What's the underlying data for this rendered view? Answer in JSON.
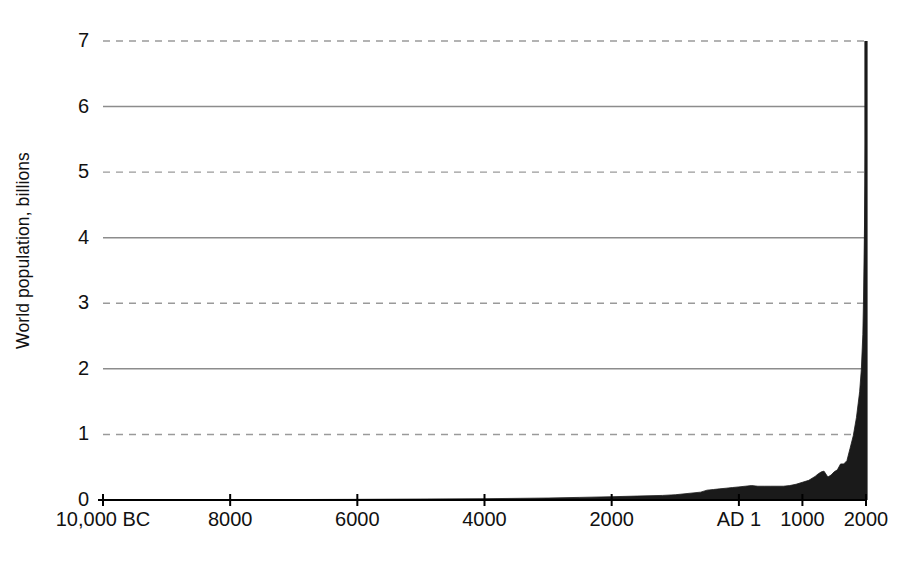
{
  "chart_data": {
    "type": "area",
    "title": "",
    "xlabel": "",
    "ylabel": "World population, billions",
    "xlim": [
      -10000,
      2000
    ],
    "ylim": [
      0,
      7
    ],
    "grid": true,
    "legend": null,
    "x_tick_labels": [
      "10,000 BC",
      "8000",
      "6000",
      "4000",
      "2000",
      "AD 1",
      "1000",
      "2000"
    ],
    "x_tick_values": [
      -10000,
      -8000,
      -6000,
      -4000,
      -2000,
      1,
      1000,
      2000
    ],
    "y_tick_labels": [
      "0",
      "1",
      "2",
      "3",
      "4",
      "5",
      "6",
      "7"
    ],
    "y_tick_values": [
      0,
      1,
      2,
      3,
      4,
      5,
      6,
      7
    ],
    "gridline_style": {
      "solid_at": [
        2,
        4,
        6
      ],
      "dashed_at": [
        1,
        3,
        5,
        7
      ]
    },
    "series": [
      {
        "name": "World population",
        "x": [
          -10000,
          -9000,
          -8000,
          -7000,
          -6000,
          -5000,
          -4000,
          -3000,
          -2500,
          -2000,
          -1600,
          -1200,
          -1000,
          -800,
          -600,
          -500,
          -400,
          -300,
          -200,
          -100,
          1,
          100,
          200,
          300,
          400,
          500,
          600,
          700,
          800,
          900,
          1000,
          1100,
          1200,
          1250,
          1300,
          1340,
          1400,
          1450,
          1500,
          1550,
          1600,
          1650,
          1700,
          1750,
          1800,
          1850,
          1900,
          1927,
          1950,
          1960,
          1975,
          1987,
          1999,
          2000
        ],
        "y": [
          0.004,
          0.005,
          0.005,
          0.007,
          0.01,
          0.015,
          0.02,
          0.03,
          0.04,
          0.05,
          0.06,
          0.07,
          0.08,
          0.1,
          0.12,
          0.15,
          0.16,
          0.17,
          0.18,
          0.19,
          0.2,
          0.21,
          0.22,
          0.21,
          0.21,
          0.21,
          0.21,
          0.21,
          0.22,
          0.24,
          0.27,
          0.3,
          0.36,
          0.4,
          0.43,
          0.44,
          0.35,
          0.38,
          0.43,
          0.46,
          0.55,
          0.55,
          0.6,
          0.79,
          0.98,
          1.26,
          1.65,
          2.0,
          2.52,
          3.02,
          4.07,
          5.0,
          6.0,
          7.0
        ]
      }
    ]
  },
  "axis": {
    "y_title": "World population, billions"
  },
  "colors": {
    "area_fill": "#1a1a1a",
    "gridline_solid": "#8c8c8c",
    "gridline_dashed": "#9a9a9a",
    "axis": "#000000",
    "text": "#111111",
    "background": "#ffffff"
  }
}
